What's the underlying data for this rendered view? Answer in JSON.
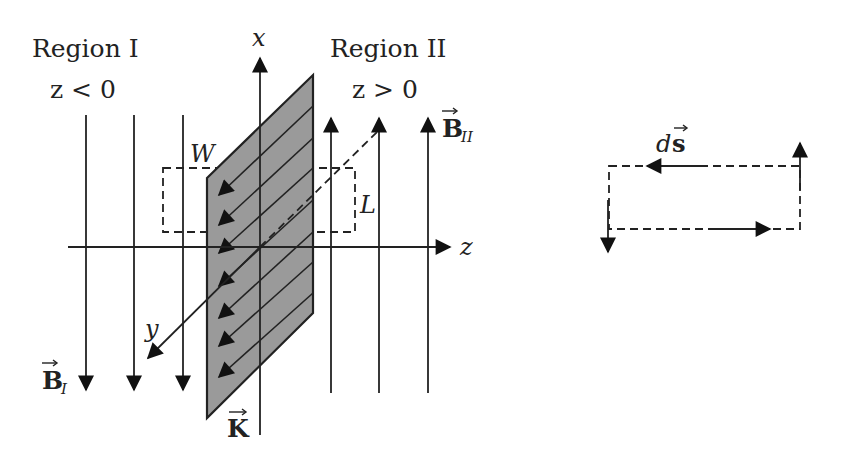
{
  "figure": {
    "regions": [
      {
        "label": "Region I",
        "condition": "z < 0",
        "field_label": "B",
        "field_subscript": "I",
        "field_direction": "down"
      },
      {
        "label": "Region II",
        "condition": "z > 0",
        "field_label": "B",
        "field_subscript": "II",
        "field_direction": "up"
      }
    ],
    "axes": {
      "x": "x",
      "y": "y",
      "z": "z"
    },
    "sheet": {
      "current_label": "K",
      "current_arrow_count": 7,
      "fill_color": "#9a9a9a"
    },
    "amperian_loop": {
      "width_label": "W",
      "length_label": "L"
    },
    "loop_detail": {
      "element_label_d": "d",
      "element_label_s": "s"
    }
  }
}
